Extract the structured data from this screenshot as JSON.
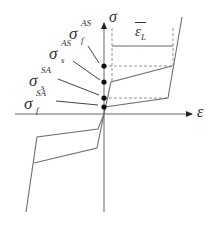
{
  "diagram": {
    "type": "stress-strain hysteresis (shape memory alloy)",
    "axes": {
      "x_label": "ε",
      "y_label": "σ"
    },
    "strain_label": {
      "base": "ε",
      "overbar": true,
      "subscript": "L"
    },
    "stress_labels": [
      {
        "id": "sigma_f_AS",
        "base": "σ",
        "superscript": "AS",
        "subscript": "f"
      },
      {
        "id": "sigma_s_AS",
        "base": "σ",
        "superscript": "AS",
        "subscript": "s"
      },
      {
        "id": "sigma_s_SA",
        "base": "σ",
        "superscript": "SA",
        "subscript": "s"
      },
      {
        "id": "sigma_f_SA",
        "base": "σ",
        "superscript": "SA",
        "subscript": "f"
      }
    ],
    "colors": {
      "line": "#6e6e6e",
      "axis": "#555555",
      "dot": "#111111",
      "text": "#333333"
    }
  }
}
